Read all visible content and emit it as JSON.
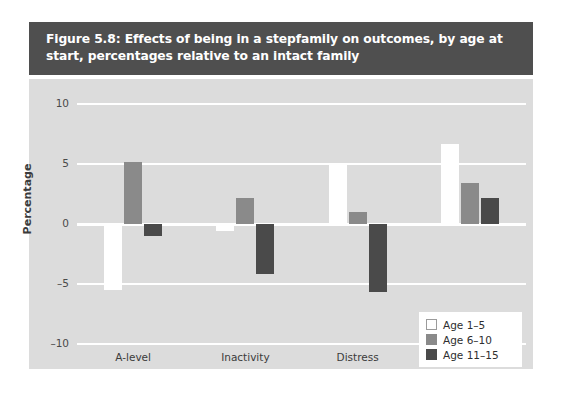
{
  "figure": {
    "title": "Figure 5.8: Effects of being in a stepfamily on outcomes, by age at start, percentages relative to an intact family"
  },
  "colors": {
    "title_band": "#4f4f4f",
    "plot_background": "#dcdcdc",
    "gridline": "#ffffff",
    "series_age_1_5": "#ffffff",
    "series_age_6_10": "#8a8a8a",
    "series_age_11_15": "#4a4a4a",
    "page_background": "#ffffff"
  },
  "chart_data": {
    "type": "bar",
    "title": "Figure 5.8: Effects of being in a stepfamily on outcomes, by age at start, percentages relative to an intact family",
    "xlabel": "",
    "ylabel": "Percentage",
    "categories": [
      "A-level",
      "Inactivity",
      "Distress",
      "Early child"
    ],
    "series": [
      {
        "name": "Age 1–5",
        "color": "#ffffff",
        "values": [
          -5.5,
          -0.6,
          4.9,
          6.7
        ]
      },
      {
        "name": "Age 6–10",
        "color": "#8a8a8a",
        "values": [
          5.2,
          2.2,
          1.0,
          3.4
        ]
      },
      {
        "name": "Age 11–15",
        "color": "#4a4a4a",
        "values": [
          -1.0,
          -4.2,
          -5.7,
          2.2
        ]
      }
    ],
    "ylim": [
      -10,
      10
    ],
    "yticks": [
      10,
      5,
      0,
      -5,
      -10
    ],
    "ytick_labels": [
      "10",
      "5",
      "0",
      "–5",
      "–10"
    ],
    "grid": true,
    "legend_position": "inside-right"
  }
}
